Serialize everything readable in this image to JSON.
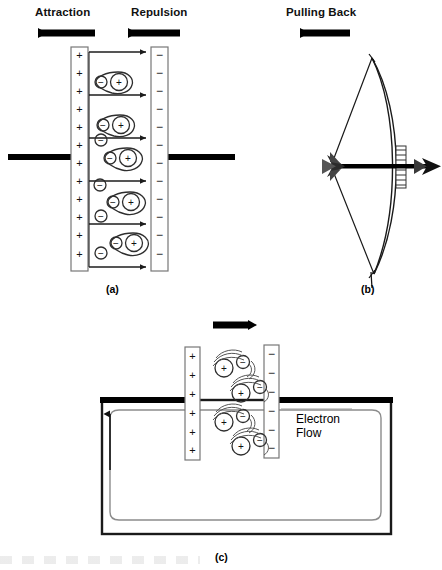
{
  "figure": {
    "title_labels": {
      "attraction": "Attraction",
      "repulsion": "Repulsion",
      "pulling_back": "Pulling Back"
    },
    "captions": {
      "a": "(a)",
      "b": "(b)",
      "c": "(c)"
    },
    "electron_flow_label": "Electron\nFlow",
    "symbols": {
      "positive": "+",
      "negative": "−"
    },
    "colors": {
      "ink": "#000000",
      "line": "#2b2b2b",
      "plate_outline": "#6e6e6e",
      "atom_outline": "#3a3a3a",
      "background": "#ffffff"
    }
  },
  "panel_a": {
    "name": "charge-separation-panel",
    "left_plate": {
      "charge": "+",
      "count": 12,
      "label": "positive-plate"
    },
    "right_plate": {
      "charge": "−",
      "count": 12,
      "label": "negative-plate"
    },
    "force_arrows": [
      {
        "label": "Attraction",
        "direction": "left"
      },
      {
        "label": "Repulsion",
        "direction": "left"
      }
    ],
    "field_arrow_count": 6,
    "atoms": [
      {
        "nucleus": "+",
        "bound_electron": "−",
        "free_electrons": 0
      },
      {
        "nucleus": "+",
        "bound_electron": "−",
        "free_electrons": 0
      },
      {
        "nucleus": "+",
        "bound_electron": "−",
        "free_electrons": 1
      },
      {
        "nucleus": "+",
        "bound_electron": "−",
        "free_electrons": 1
      },
      {
        "nucleus": "+",
        "bound_electron": "−",
        "free_electrons": 2
      }
    ],
    "wire_left": true,
    "wire_right": true
  },
  "panel_b": {
    "name": "bow-and-arrow-panel",
    "arrow_label": "Pulling Back",
    "arrow_direction": "left",
    "bow_drawn": true,
    "arrow_points": "right"
  },
  "panel_c": {
    "name": "electron-flow-circuit-panel",
    "top_arrow_direction": "right",
    "left_plate": {
      "charge": "+",
      "count": 6
    },
    "right_plate": {
      "charge": "−",
      "count": 6
    },
    "atoms": [
      {
        "nucleus": "+",
        "electron": "−"
      },
      {
        "nucleus": "+",
        "electron": "−"
      },
      {
        "nucleus": "+",
        "electron": "−"
      },
      {
        "nucleus": "+",
        "electron": "−"
      }
    ],
    "flow_label": "Electron\nFlow",
    "circuit_arrow_direction": "up"
  }
}
